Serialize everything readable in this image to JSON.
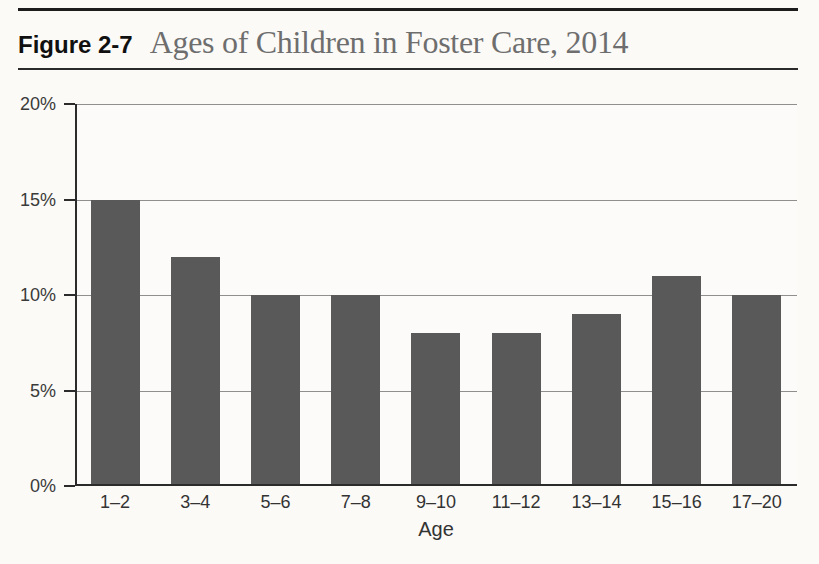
{
  "figure": {
    "label": "Figure 2-7",
    "title": "Ages of Children in Foster Care, 2014"
  },
  "chart_data": {
    "type": "bar",
    "title": "Ages of Children in Foster Care, 2014",
    "figure_label": "Figure 2-7",
    "categories": [
      "1–2",
      "3–4",
      "5–6",
      "7–8",
      "9–10",
      "11–12",
      "13–14",
      "15–16",
      "17–20"
    ],
    "values": [
      15,
      12,
      10,
      10,
      8,
      8,
      9,
      11,
      10
    ],
    "xlabel": "Age",
    "ylabel": "",
    "ylim": [
      0,
      20
    ],
    "yticks": [
      0,
      5,
      10,
      15,
      20
    ],
    "ytick_labels": [
      "0%",
      "5%",
      "10%",
      "15%",
      "20%"
    ],
    "grid": true,
    "legend": "none",
    "bar_color": "#595959",
    "axis_color": "#2b2b2b",
    "gridline_color": "#8f8f8f"
  }
}
